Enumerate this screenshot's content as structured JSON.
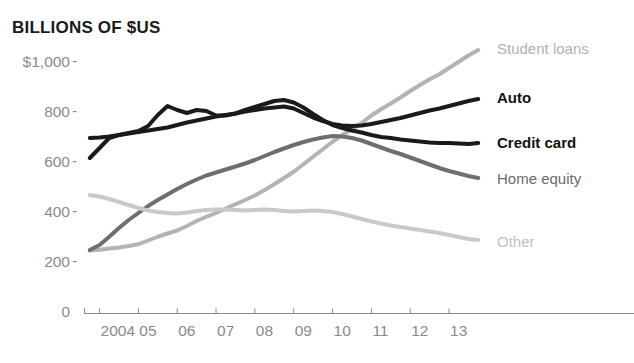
{
  "chart_data": {
    "type": "line",
    "title": "BILLIONS OF $US",
    "xlabel": "",
    "ylabel": "BILLIONS OF $US",
    "grid": false,
    "legend_position": "right-of-lines",
    "ylim": [
      0,
      1100
    ],
    "xlim": [
      2003.6,
      2013.9
    ],
    "y_ticks": [
      {
        "value": 1000,
        "label": "$1,000"
      },
      {
        "value": 800,
        "label": "800"
      },
      {
        "value": 600,
        "label": "600"
      },
      {
        "value": 400,
        "label": "400"
      },
      {
        "value": 200,
        "label": "200"
      },
      {
        "value": 0,
        "label": "0"
      }
    ],
    "x_ticks": [
      {
        "value": 2004,
        "label": "2004"
      },
      {
        "value": 2005,
        "label": "05"
      },
      {
        "value": 2006,
        "label": "06"
      },
      {
        "value": 2007,
        "label": "07"
      },
      {
        "value": 2008,
        "label": "08"
      },
      {
        "value": 2009,
        "label": "09"
      },
      {
        "value": 2010,
        "label": "10"
      },
      {
        "value": 2011,
        "label": "11"
      },
      {
        "value": 2012,
        "label": "12"
      },
      {
        "value": 2013,
        "label": "13"
      }
    ],
    "x": [
      2003.75,
      2004.0,
      2004.25,
      2004.5,
      2004.75,
      2005.0,
      2005.25,
      2005.5,
      2005.75,
      2006.0,
      2006.25,
      2006.5,
      2006.75,
      2007.0,
      2007.25,
      2007.5,
      2007.75,
      2008.0,
      2008.25,
      2008.5,
      2008.75,
      2009.0,
      2009.25,
      2009.5,
      2009.75,
      2010.0,
      2010.25,
      2010.5,
      2010.75,
      2011.0,
      2011.25,
      2011.5,
      2011.75,
      2012.0,
      2012.25,
      2012.5,
      2012.75,
      2013.0,
      2013.25,
      2013.5,
      2013.75
    ],
    "series": [
      {
        "name": "Student loans",
        "color": "#b3b3b3",
        "label_color": "#b0b0b0",
        "label_bold": false,
        "width": 4,
        "values": [
          250,
          253,
          258,
          262,
          268,
          275,
          290,
          305,
          318,
          330,
          348,
          368,
          385,
          400,
          418,
          435,
          452,
          470,
          492,
          515,
          540,
          565,
          595,
          625,
          655,
          685,
          712,
          735,
          760,
          790,
          815,
          838,
          862,
          888,
          912,
          935,
          955,
          980,
          1005,
          1030,
          1052
        ]
      },
      {
        "name": "Auto",
        "color": "#1a1a1a",
        "label_color": "#111111",
        "label_bold": true,
        "width": 4,
        "values": [
          700,
          702,
          706,
          712,
          718,
          724,
          730,
          736,
          742,
          752,
          762,
          770,
          778,
          786,
          792,
          798,
          806,
          812,
          818,
          822,
          826,
          818,
          800,
          782,
          768,
          756,
          750,
          748,
          750,
          756,
          764,
          772,
          780,
          790,
          800,
          810,
          818,
          828,
          838,
          848,
          856
        ]
      },
      {
        "name": "Credit card",
        "color": "#1a1a1a",
        "label_color": "#111111",
        "label_bold": true,
        "width": 4,
        "values": [
          620,
          660,
          700,
          712,
          720,
          728,
          748,
          792,
          828,
          812,
          800,
          812,
          808,
          790,
          790,
          798,
          812,
          824,
          836,
          848,
          852,
          842,
          822,
          796,
          772,
          752,
          740,
          730,
          722,
          712,
          704,
          700,
          694,
          690,
          686,
          682,
          680,
          680,
          678,
          676,
          680
        ]
      },
      {
        "name": "Home equity",
        "color": "#6e6e6e",
        "label_color": "#6b6b6b",
        "label_bold": false,
        "width": 4,
        "values": [
          252,
          272,
          305,
          340,
          372,
          400,
          428,
          452,
          474,
          496,
          516,
          534,
          550,
          562,
          574,
          586,
          598,
          612,
          628,
          644,
          658,
          672,
          684,
          694,
          702,
          708,
          706,
          700,
          690,
          676,
          662,
          648,
          636,
          622,
          608,
          594,
          580,
          568,
          558,
          548,
          540
        ]
      },
      {
        "name": "Other",
        "color": "#c9c9c9",
        "label_color": "#c2c2c2",
        "label_bold": false,
        "width": 4,
        "values": [
          472,
          466,
          456,
          444,
          432,
          420,
          410,
          404,
          400,
          398,
          402,
          408,
          412,
          414,
          414,
          412,
          410,
          412,
          414,
          412,
          408,
          406,
          408,
          410,
          408,
          404,
          396,
          386,
          376,
          366,
          358,
          350,
          344,
          338,
          332,
          326,
          320,
          312,
          304,
          296,
          292
        ]
      }
    ],
    "series_labels": [
      {
        "text": "Student loans",
        "x": 497,
        "y": 40,
        "color": "#b0b0b0",
        "bold": false
      },
      {
        "text": "Auto",
        "x": 497,
        "y": 89,
        "color": "#111111",
        "bold": true
      },
      {
        "text": "Credit card",
        "x": 497,
        "y": 134,
        "color": "#111111",
        "bold": true
      },
      {
        "text": "Home equity",
        "x": 497,
        "y": 170,
        "color": "#6b6b6b",
        "bold": false
      },
      {
        "text": "Other",
        "x": 497,
        "y": 233,
        "color": "#c2c2c2",
        "bold": false
      }
    ],
    "axis_color": "#8a8a8a"
  }
}
